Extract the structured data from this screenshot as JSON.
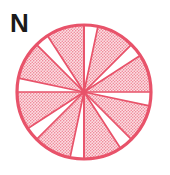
{
  "figure": {
    "type": "rose-diagram",
    "orientation_label": "N",
    "background_color": "#ffffff"
  },
  "colors": {
    "outline": "#e8536a",
    "wedge_stroke": "#e8536a",
    "wedge_fill": "#f4a3ae",
    "stipple_dot": "#e8536a",
    "label_text": "#1a1a1a"
  },
  "circle": {
    "center_x": 84,
    "center_y": 92,
    "radius": 67,
    "stroke_width": 3.2
  },
  "chart_data": {
    "type": "pie",
    "title": "",
    "subtitle": "",
    "xlabel": "",
    "ylabel": "",
    "legend_position": "none",
    "grid": false,
    "orientation_label": "N",
    "units": "degrees",
    "categories": [
      "Petal 1",
      "Petal 2",
      "Petal 3",
      "Petal 4",
      "Petal 5",
      "Petal 6",
      "Petal 7",
      "Petal 8"
    ],
    "values": [
      33,
      33,
      33,
      33,
      33,
      33,
      33,
      33
    ],
    "petals": [
      {
        "label": "Petal 1",
        "start_deg": 327,
        "end_deg": 360,
        "radius_fraction": 1.0,
        "filled": true
      },
      {
        "label": "Petal 2",
        "start_deg": 12,
        "end_deg": 45,
        "radius_fraction": 1.0,
        "filled": true
      },
      {
        "label": "Petal 3",
        "start_deg": 57,
        "end_deg": 90,
        "radius_fraction": 1.0,
        "filled": true
      },
      {
        "label": "Petal 4",
        "start_deg": 102,
        "end_deg": 135,
        "radius_fraction": 1.0,
        "filled": true
      },
      {
        "label": "Petal 5",
        "start_deg": 147,
        "end_deg": 180,
        "radius_fraction": 1.0,
        "filled": true
      },
      {
        "label": "Petal 6",
        "start_deg": 192,
        "end_deg": 225,
        "radius_fraction": 1.0,
        "filled": true
      },
      {
        "label": "Petal 7",
        "start_deg": 237,
        "end_deg": 270,
        "radius_fraction": 1.0,
        "filled": true
      },
      {
        "label": "Petal 8",
        "start_deg": 282,
        "end_deg": 315,
        "radius_fraction": 1.0,
        "filled": true
      }
    ],
    "gaps": [
      {
        "start_deg": 0,
        "end_deg": 12
      },
      {
        "start_deg": 45,
        "end_deg": 57
      },
      {
        "start_deg": 90,
        "end_deg": 102
      },
      {
        "start_deg": 135,
        "end_deg": 147
      },
      {
        "start_deg": 180,
        "end_deg": 192
      },
      {
        "start_deg": 225,
        "end_deg": 237
      },
      {
        "start_deg": 270,
        "end_deg": 282
      },
      {
        "start_deg": 315,
        "end_deg": 327
      }
    ],
    "reference_lines": [
      {
        "name": "north-radius",
        "angle_deg": 0
      },
      {
        "name": "south-radius",
        "angle_deg": 180
      }
    ]
  }
}
